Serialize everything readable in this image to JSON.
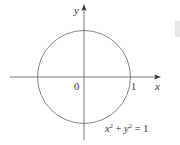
{
  "figure": {
    "axes": {
      "x_label": "x",
      "y_label": "y",
      "origin_label": "0",
      "x_tick_label": "1"
    },
    "equation": {
      "x_var": "x",
      "x_exp": "2",
      "plus": " + ",
      "y_var": "y",
      "y_exp": "2",
      "rhs": " = 1"
    },
    "colors": {
      "axis": "#444444",
      "circle": "#777777",
      "text": "#333333",
      "edge_mark": "#e6e6e6"
    }
  }
}
